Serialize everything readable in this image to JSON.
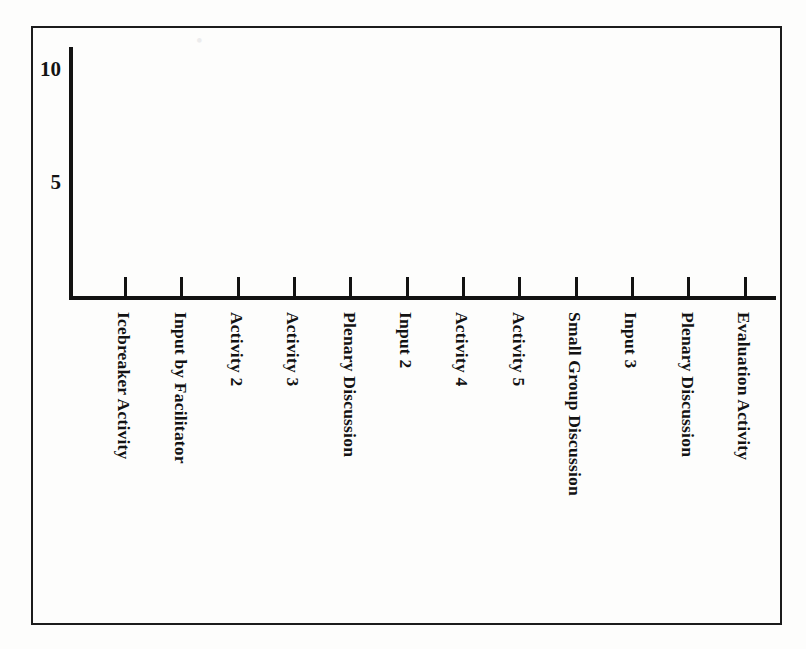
{
  "figure": {
    "kind": "blank-bar-chart-template",
    "frame_border_color": "#1c1c1c",
    "axis_color": "#121212",
    "paper_color": "#fdfdfc"
  },
  "bleed_through": {
    "line_a": "•  ",
    "line_b": "",
    "line_c": "",
    "line_d": "",
    "line_e": "",
    "line_f": ""
  },
  "chart_data": {
    "type": "bar",
    "title": "",
    "xlabel": "",
    "ylabel": "",
    "ylim": [
      0,
      11
    ],
    "yticks": [
      5,
      10
    ],
    "ytick_labels": [
      "5",
      "10"
    ],
    "grid": false,
    "legend": false,
    "categories": [
      "Icebreaker Activity",
      "Input by Facilitator",
      "Activity 2",
      "Activity 3",
      "Plenary Discussion",
      "Input 2",
      "Activity 4",
      "Activity 5",
      "Small Group Discussion",
      "Input 3",
      "Plenary Discussion",
      "Evaluation Activity"
    ],
    "values": [
      0,
      0,
      0,
      0,
      0,
      0,
      0,
      0,
      0,
      0,
      0,
      0
    ],
    "note": "No bars are drawn; the figure is an empty axis template for readers to fill in."
  }
}
